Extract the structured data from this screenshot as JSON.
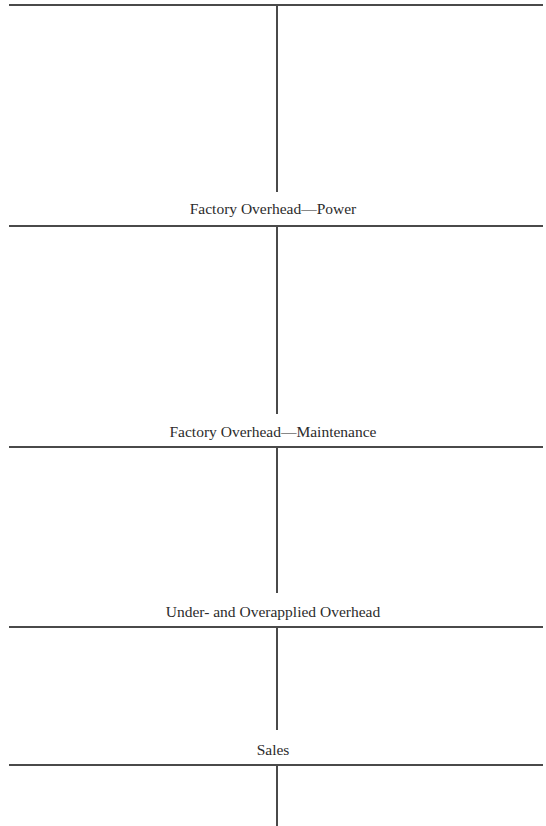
{
  "page": {
    "type": "T-account worksheet",
    "accounts": [
      {
        "id": "continued-account",
        "title": ""
      },
      {
        "id": "factory-overhead-power",
        "title": "Factory Overhead—Power"
      },
      {
        "id": "factory-overhead-maintenance",
        "title": "Factory Overhead—Maintenance"
      },
      {
        "id": "under-overapplied-overhead",
        "title": "Under- and Overapplied Overhead"
      },
      {
        "id": "sales",
        "title": "Sales"
      }
    ]
  }
}
